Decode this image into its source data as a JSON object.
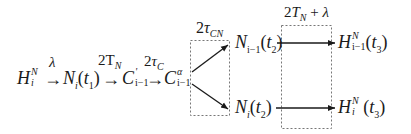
{
  "diagram": {
    "chain": [
      {
        "id": "H_i_N",
        "base": "H",
        "sup": "N",
        "sub": "i",
        "tail": ""
      },
      {
        "id": "N_i_t1",
        "base": "N",
        "sub": "i",
        "tail": "(t",
        "tail_sub": "1",
        "tail_end": ")"
      },
      {
        "id": "C_prime_i-1",
        "base": "C",
        "sup": "'",
        "sub": "i−1",
        "tail": ""
      },
      {
        "id": "C_alpha_i-1",
        "base": "C",
        "sup": "α",
        "sub": "i−1",
        "tail": ""
      }
    ],
    "arrow_labels": {
      "a1": "λ",
      "a2_base": "2T",
      "a2_sub": "N",
      "a3_base": "2τ",
      "a3_sub": "C",
      "box1_base": "2τ",
      "box1_sub": "CN",
      "box2_base": "2T",
      "box2_sub": "N",
      "box2_tail": " + λ"
    },
    "branch_nodes": {
      "upper": {
        "base": "N",
        "sub": "i−1",
        "tail": "(t",
        "tail_sub": "2",
        "tail_end": ")"
      },
      "lower": {
        "base": "N",
        "sub": "i",
        "tail": "(t",
        "tail_sub": "2",
        "tail_end": ")"
      }
    },
    "result_nodes": {
      "upper": {
        "base": "H",
        "sup": "N",
        "sub": "i−1",
        "tail": "(t",
        "tail_sub": "3",
        "tail_end": ")"
      },
      "lower": {
        "base": "H",
        "sup": "N",
        "sub": "i",
        "tail": "(t",
        "tail_sub": "3",
        "tail_end": ")"
      }
    },
    "arrow_glyph": "→",
    "colors": {
      "ink": "#1a1a1a",
      "box_border": "#777777",
      "background": "#ffffff"
    }
  }
}
